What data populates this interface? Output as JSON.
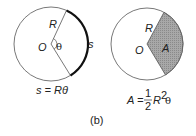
{
  "left_diagram": {
    "radius_label": "R",
    "center_label": "O",
    "angle_label": "θ",
    "arc_label": "s",
    "formula": "s = Rθ"
  },
  "right_diagram": {
    "radius_label": "R",
    "center_label": "O",
    "area_label": "A",
    "formula_lhs": "A = ",
    "formula_num": "1",
    "formula_den": "2",
    "formula_rhs": "R",
    "formula_exp": "2",
    "formula_theta": "θ"
  },
  "caption": "(b)",
  "colors": {
    "sector_fill": "#9a9a9a",
    "stroke": "#333333"
  }
}
